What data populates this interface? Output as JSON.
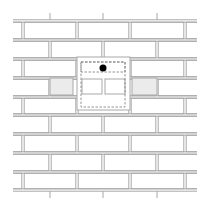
{
  "diagram": {
    "type": "brick-wall-bond",
    "colors": {
      "mortar_stroke": "#a8a8a8",
      "brick_fill": "#ffffff",
      "shaded_brick_fill": "#ebebeb",
      "dashed_outline": "#7a7a7a",
      "marker": "#000000"
    },
    "courses": 9,
    "course_height": 19,
    "wall_x_range": [
      13,
      197
    ],
    "course_top_y": [
      21,
      40,
      59,
      78,
      97,
      115,
      134,
      153,
      172
    ],
    "wall_bottom_y": 190,
    "odd_course_joints_x": [
      23,
      77,
      130,
      185
    ],
    "even_course_joints_x": [
      50,
      103,
      157
    ],
    "top_stubs_x": [
      50,
      103,
      157
    ],
    "bottom_stubs_x": [
      50,
      103,
      157
    ],
    "shaded_bricks": [
      {
        "x": 50,
        "y": 78,
        "w": 23,
        "h": 17
      },
      {
        "x": 132,
        "y": 78,
        "w": 25,
        "h": 17
      }
    ],
    "opening": {
      "x": 77,
      "y": 57,
      "w": 53,
      "h": 53
    },
    "dashed_regions": [
      {
        "x": 81,
        "y": 62,
        "w": 44,
        "h": 45
      },
      {
        "x": 81,
        "y": 62,
        "w": 44,
        "h": 10
      }
    ],
    "inner_bricks": [
      {
        "x": 82,
        "y": 79,
        "w": 20,
        "h": 15
      },
      {
        "x": 105,
        "y": 79,
        "w": 20,
        "h": 15
      }
    ],
    "marker": {
      "cx": 103,
      "cy": 68,
      "r": 3.5
    }
  }
}
